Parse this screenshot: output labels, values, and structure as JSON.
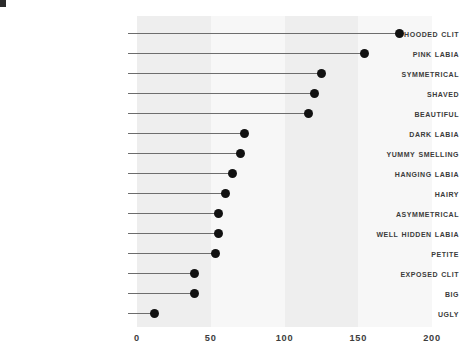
{
  "chart_data": {
    "type": "bar",
    "subtype": "lollipop-horizontal",
    "title": "",
    "subtitle": "",
    "xlabel": "",
    "ylabel": "",
    "xlim": [
      0,
      200
    ],
    "xticks": [
      0,
      50,
      100,
      150,
      200
    ],
    "xtick_labels": [
      "0",
      "50",
      "100",
      "150",
      "200"
    ],
    "grid": false,
    "bands": true,
    "legend": null,
    "orientation": "horizontal",
    "categories": [
      "Hooded Clit",
      "Pink Labia",
      "Symmetrical",
      "Shaved",
      "Beautiful",
      "Dark Labia",
      "Yummy Smelling",
      "Hanging Labia",
      "Hairy",
      "Asymmetrical",
      "Well Hidden Labia",
      "Petite",
      "Exposed Clit",
      "Big",
      "Ugly"
    ],
    "values": [
      178,
      154,
      125,
      120,
      116,
      73,
      70,
      65,
      60,
      55,
      55,
      53,
      39,
      39,
      12
    ],
    "colors": {
      "dot": "#111111",
      "stem": "#6d6d6d",
      "band_dark": "#eeeeee",
      "band_light": "#f7f7f7",
      "label_text": "#3b3b3b",
      "tick_text": "#3d3d3d",
      "background": "#ffffff"
    }
  }
}
